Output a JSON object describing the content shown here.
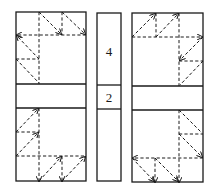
{
  "diagram": {
    "type": "folding-pattern-figure",
    "panels": [
      {
        "id": "left",
        "description": "rectangle with horizontal band; dashed fold lines with arrows in top-left and bottom-left quadrants"
      },
      {
        "id": "middle",
        "description": "narrow strip with two labeled segments",
        "labels": [
          "4",
          "2"
        ]
      },
      {
        "id": "right",
        "description": "rectangle with horizontal band; dashed fold lines with arrows in top-right and bottom-right quadrants"
      }
    ],
    "middle_labels": {
      "top": "4",
      "band": "2"
    },
    "colors": {
      "line": "#1a1a1a",
      "background": "#ffffff"
    }
  }
}
